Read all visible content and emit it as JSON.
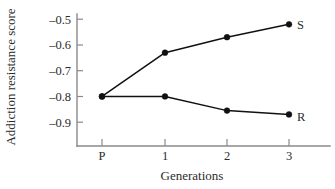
{
  "chart_data": {
    "type": "line",
    "title": "",
    "subtitle": "",
    "xlabel": "Generations",
    "ylabel": "Addiction resistance score",
    "x": [
      "P",
      "1",
      "2",
      "3"
    ],
    "categories": [
      "P",
      "1",
      "2",
      "3"
    ],
    "xtick_labels": [
      "P",
      "1",
      "2",
      "3"
    ],
    "ytick_labels": [
      "–0.5",
      "–0.6",
      "–0.7",
      "–0.8",
      "–0.9"
    ],
    "ytick_values": [
      -0.5,
      -0.6,
      -0.7,
      -0.8,
      -0.9
    ],
    "ylim": [
      -0.95,
      -0.47
    ],
    "xlim": [
      -0.35,
      3.35
    ],
    "grid": false,
    "legend": "inline-right-endpoint",
    "marker": "filled-circle",
    "series": [
      {
        "name": "S",
        "label": "S",
        "color": "#111111",
        "values": [
          -0.8,
          -0.63,
          -0.57,
          -0.52
        ]
      },
      {
        "name": "R",
        "label": "R",
        "color": "#111111",
        "values": [
          -0.8,
          -0.8,
          -0.855,
          -0.87
        ]
      }
    ],
    "annotations": [
      {
        "text": "S",
        "x": 3,
        "y": -0.52
      },
      {
        "text": "R",
        "x": 3,
        "y": -0.87
      }
    ]
  },
  "axes": {
    "y_title": "Addiction resistance score",
    "x_title": "Generations",
    "axis_color": "#8a8a8a"
  },
  "ticks": {
    "y": [
      {
        "label": "–0.5",
        "value": -0.5
      },
      {
        "label": "–0.6",
        "value": -0.6
      },
      {
        "label": "–0.7",
        "value": -0.7
      },
      {
        "label": "–0.8",
        "value": -0.8
      },
      {
        "label": "–0.9",
        "value": -0.9
      }
    ],
    "x": [
      {
        "label": "P"
      },
      {
        "label": "1"
      },
      {
        "label": "2"
      },
      {
        "label": "3"
      }
    ]
  },
  "labels": {
    "series_s": "S",
    "series_r": "R"
  }
}
